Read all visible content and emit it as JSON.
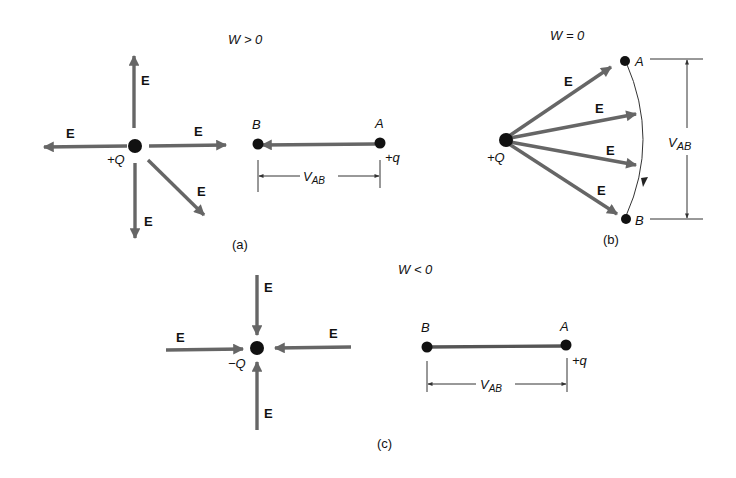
{
  "panels": {
    "a": {
      "caption": "(a)",
      "condition": "W > 0",
      "charge": "+Q",
      "field_label": "E",
      "test_charge": "+q",
      "point_a": "A",
      "point_b": "B",
      "voltage": "V",
      "voltage_sub": "AB"
    },
    "b": {
      "caption": "(b)",
      "condition": "W = 0",
      "charge": "+Q",
      "field_label": "E",
      "point_a": "A",
      "point_b": "B",
      "voltage": "V",
      "voltage_sub": "AB"
    },
    "c": {
      "caption": "(c)",
      "condition": "W < 0",
      "charge": "−Q",
      "field_label": "E",
      "test_charge": "+q",
      "point_a": "A",
      "point_b": "B",
      "voltage": "V",
      "voltage_sub": "AB"
    }
  },
  "colors": {
    "arrow": "#666666",
    "dot": "#111111",
    "line": "#333333"
  }
}
